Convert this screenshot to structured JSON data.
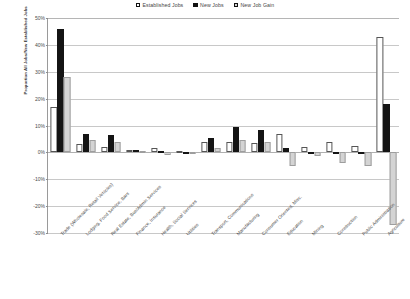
{
  "chart_data": {
    "type": "bar",
    "title": "",
    "xlabel": "",
    "ylabel": "Proportion All Jobs/New Established Jobs",
    "ylim": [
      -30,
      50
    ],
    "ytick_values": [
      50,
      40,
      30,
      20,
      10,
      0,
      -10,
      -20,
      -30
    ],
    "ytick_labels": [
      "50%",
      "40%",
      "30%",
      "20%",
      "10%",
      "0%",
      "-10%",
      "-20%",
      "-30%"
    ],
    "grid": true,
    "legend_position": "top-center",
    "categories": [
      "Trade (Wholesale, Retail Vehicles)",
      "Lodging, Food Service, Bars",
      "Real Estate, Bus/Admin Services",
      "Finance, Insurance",
      "Health, Social Services",
      "Utilities",
      "Transport, Communications",
      "Manufacturing",
      "Consumer Oriented, Misc.",
      "Education",
      "Mining",
      "Construction",
      "Public Administration",
      "Agriculture"
    ],
    "series": [
      {
        "name": "Established Jobs",
        "color": "#ffffff",
        "values": [
          17,
          3,
          2,
          1,
          1.5,
          0.5,
          4,
          4,
          3.5,
          7,
          2,
          4,
          2.5,
          43
        ]
      },
      {
        "name": "New Jobs",
        "color": "#141414",
        "values": [
          46,
          7,
          6.5,
          1,
          0.5,
          0.2,
          5.5,
          9.5,
          8.5,
          1.5,
          0.3,
          0.2,
          0.2,
          18
        ]
      },
      {
        "name": "New Job Gain",
        "color": "#d4d4d4",
        "values": [
          28,
          4.5,
          4,
          0.5,
          -1,
          -0.5,
          1.5,
          4.5,
          4,
          -5,
          -1.5,
          -4,
          -5,
          -27
        ]
      }
    ]
  },
  "legend": {
    "entries": [
      {
        "label": "Established Jobs",
        "swatch": "established-swatch"
      },
      {
        "label": "New Jobs",
        "swatch": "new-jobs-swatch"
      },
      {
        "label": "New Job Gain",
        "swatch": "new-job-gain-swatch"
      }
    ]
  }
}
